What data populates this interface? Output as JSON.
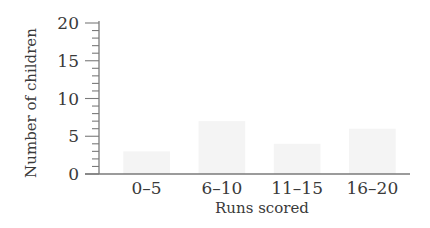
{
  "chart_data": {
    "type": "bar",
    "title": "",
    "xlabel": "Runs scored",
    "ylabel": "Number of children",
    "categories": [
      "0–5",
      "6–10",
      "11–15",
      "16–20"
    ],
    "values": [
      3,
      7,
      4,
      6
    ],
    "ylim": [
      0,
      20
    ],
    "yticks": [
      0,
      5,
      10,
      15,
      20
    ],
    "minor_tick_step": 1,
    "grid": false,
    "legend": null,
    "bar_color": "#f4f4f4",
    "axis_color": "#7a7a7a",
    "text_color": "#3a3a3a"
  }
}
